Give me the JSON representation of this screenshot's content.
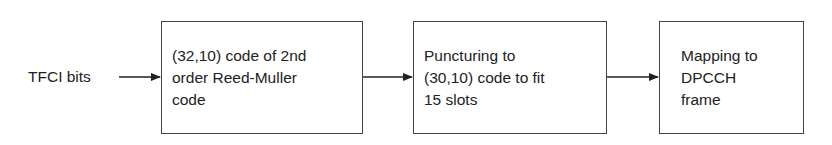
{
  "diagram": {
    "input_label": "TFCI bits",
    "blocks": [
      {
        "lines": [
          "(32,10) code of 2nd",
          "order Reed-Muller",
          "code"
        ]
      },
      {
        "lines": [
          "Puncturing to",
          "(30,10) code to fit",
          "15 slots"
        ]
      },
      {
        "lines": [
          "Mapping to",
          "DPCCH",
          "frame"
        ]
      }
    ]
  }
}
